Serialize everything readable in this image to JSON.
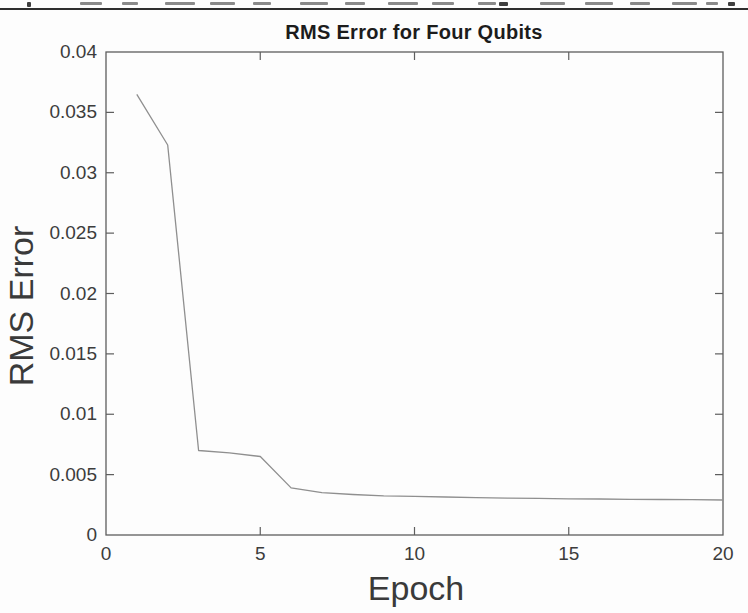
{
  "page": {
    "divider_color": "#2e2e2e",
    "background": "#fdfdfd"
  },
  "chart_data": {
    "type": "line",
    "title": "RMS Error for Four Qubits",
    "xlabel": "Epoch",
    "ylabel": "RMS Error",
    "x": [
      1,
      2,
      3,
      4,
      5,
      6,
      7,
      8,
      9,
      10,
      11,
      12,
      13,
      14,
      15,
      16,
      17,
      18,
      19,
      20
    ],
    "y": [
      0.0365,
      0.0323,
      0.007,
      0.0068,
      0.0065,
      0.0039,
      0.0035,
      0.00335,
      0.00325,
      0.0032,
      0.00315,
      0.0031,
      0.00305,
      0.00303,
      0.003,
      0.00298,
      0.00296,
      0.00294,
      0.00292,
      0.0029
    ],
    "series_name": "RMS error",
    "xlim": [
      0,
      20
    ],
    "ylim": [
      0,
      0.04
    ],
    "xticks": [
      0,
      5,
      10,
      15,
      20
    ],
    "xtick_labels": [
      "0",
      "5",
      "10",
      "15",
      "20"
    ],
    "yticks": [
      0,
      0.005,
      0.01,
      0.015,
      0.02,
      0.025,
      0.03,
      0.035,
      0.04
    ],
    "ytick_labels": [
      "0",
      "0.005",
      "0.01",
      "0.015",
      "0.02",
      "0.025",
      "0.03",
      "0.035",
      "0.04"
    ],
    "grid": false,
    "legend": null,
    "box": true,
    "colors": {
      "line": "#8f8f8f",
      "axis": "#5e5e5e",
      "tick_text": "#3c3c3c",
      "title_text": "#1c1c1c"
    }
  }
}
